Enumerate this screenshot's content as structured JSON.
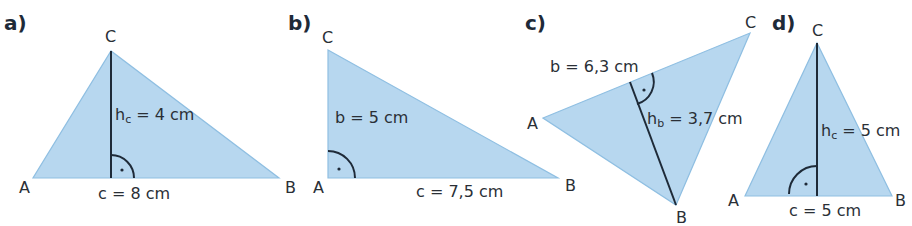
{
  "figure": {
    "colors": {
      "fill": "#b7d7ef",
      "edge": "#8fbfe2",
      "ink": "#1e2a38"
    },
    "triangles": [
      {
        "label": "a)",
        "vertices": {
          "A": "A",
          "B": "B",
          "C": "C"
        },
        "measures": {
          "side": "c = 8 cm",
          "height_main": "h",
          "height_sub": "c",
          "height_rest": " = 4 cm"
        }
      },
      {
        "label": "b)",
        "vertices": {
          "A": "A",
          "B": "B",
          "C": "C"
        },
        "measures": {
          "side1": "b = 5 cm",
          "side2": "c = 7,5 cm"
        }
      },
      {
        "label": "c)",
        "vertices": {
          "A": "A",
          "B": "B",
          "C": "C"
        },
        "measures": {
          "side": "b = 6,3 cm",
          "height_main": "h",
          "height_sub": "b",
          "height_rest": " = 3,7 cm"
        }
      },
      {
        "label": "d)",
        "vertices": {
          "A": "A",
          "B": "B",
          "C": "C"
        },
        "measures": {
          "side": "c = 5 cm",
          "height_main": "h",
          "height_sub": "c",
          "height_rest": " = 5 cm"
        }
      }
    ]
  }
}
